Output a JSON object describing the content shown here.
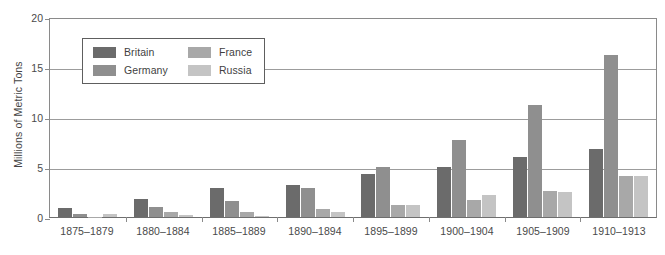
{
  "chart_data": {
    "type": "bar",
    "title": "",
    "xlabel": "",
    "ylabel": "Millions of Metric Tons",
    "ylim": [
      0,
      20
    ],
    "yticks": [
      0,
      5,
      10,
      15,
      20
    ],
    "grid": true,
    "legend_position": "upper-left-inside",
    "categories": [
      "1875–1879",
      "1880–1884",
      "1885–1889",
      "1890–1894",
      "1895–1899",
      "1900–1904",
      "1905–1909",
      "1910–1913"
    ],
    "series": [
      {
        "name": "Britain",
        "color": "#6b6b6b",
        "values": [
          0.9,
          1.8,
          2.9,
          3.2,
          4.3,
          5.0,
          6.0,
          6.8
        ]
      },
      {
        "name": "Germany",
        "color": "#8f8f8f",
        "values": [
          0.3,
          1.0,
          1.6,
          2.9,
          5.0,
          7.7,
          11.2,
          16.2
        ]
      },
      {
        "name": "France",
        "color": "#a8a8a8",
        "values": [
          0.05,
          0.5,
          0.5,
          0.8,
          1.2,
          1.7,
          2.6,
          4.1
        ]
      },
      {
        "name": "Russia",
        "color": "#c4c4c4",
        "values": [
          0.3,
          0.2,
          0.1,
          0.5,
          1.2,
          2.2,
          2.5,
          4.1
        ]
      }
    ]
  },
  "axis": {
    "y_title": "Millions of Metric Tons"
  }
}
